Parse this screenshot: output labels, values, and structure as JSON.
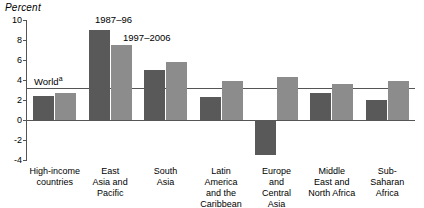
{
  "chart_data": {
    "type": "bar",
    "title": "",
    "ylabel": "Percent",
    "xlabel": "",
    "ylim": [
      -4,
      10
    ],
    "yticks": [
      -4,
      -2,
      0,
      2,
      4,
      6,
      8,
      10
    ],
    "ytick_labels": [
      "-4",
      "-2",
      "0",
      "2",
      "4",
      "6",
      "8",
      "10"
    ],
    "grid": false,
    "legend_position": "inline-annotation",
    "categories": [
      "High-income\ncountries",
      "East\nAsia and\nPacific",
      "South\nAsia",
      "Latin\nAmerica\nand the\nCaribbean",
      "Europe\nand\nCentral\nAsia",
      "Middle\nEast and\nNorth Africa",
      "Sub-\nSaharan\nAfrica"
    ],
    "series": [
      {
        "name": "1987–96",
        "color": "#595959",
        "values": [
          2.4,
          9.0,
          5.0,
          2.3,
          -3.5,
          2.7,
          2.0
        ]
      },
      {
        "name": "1997–2006",
        "color": "#8c8c8c",
        "values": [
          2.7,
          7.5,
          5.8,
          3.9,
          4.3,
          3.6,
          3.9
        ]
      }
    ],
    "reference_lines": [
      {
        "label": "World",
        "superscript": "a",
        "value": 3.2,
        "color": "#555555"
      }
    ],
    "annotations": [
      {
        "text": "1987–96",
        "series_index": 0
      },
      {
        "text": "1997–2006",
        "series_index": 1
      }
    ]
  }
}
